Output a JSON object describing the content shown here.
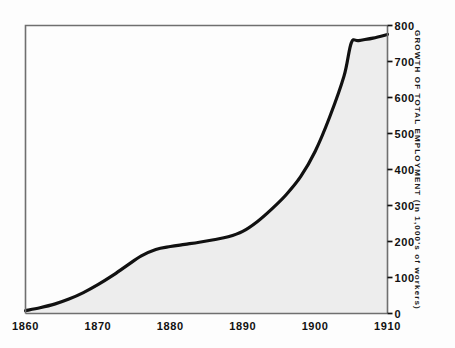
{
  "chart_data": {
    "type": "area",
    "title": "",
    "subtitle": "",
    "xlabel": "",
    "ylabel": "GROWTH OF TOTAL EMPLOYMENT (in 1,000's of workers)",
    "xlim": [
      1860,
      1910
    ],
    "ylim": [
      0,
      800
    ],
    "xticks": [
      1860,
      1870,
      1880,
      1890,
      1900,
      1910
    ],
    "xtick_labels": [
      "1860",
      "1870",
      "1880",
      "1890",
      "1900",
      "1910"
    ],
    "yticks": [
      0,
      100,
      200,
      300,
      400,
      500,
      600,
      700,
      800
    ],
    "ytick_labels": [
      "0",
      "100",
      "200",
      "300",
      "400",
      "500",
      "600",
      "700",
      "800"
    ],
    "grid": false,
    "legend": null,
    "y_axis_position": "right",
    "series": [
      {
        "name": "Total employment",
        "x": [
          1860,
          1862,
          1864,
          1866,
          1868,
          1870,
          1872,
          1874,
          1876,
          1878,
          1880,
          1882,
          1884,
          1886,
          1888,
          1890,
          1892,
          1894,
          1896,
          1898,
          1900,
          1902,
          1904,
          1905,
          1906,
          1908,
          1910
        ],
        "values": [
          8,
          16,
          26,
          40,
          58,
          80,
          105,
          133,
          160,
          178,
          186,
          192,
          198,
          205,
          213,
          228,
          255,
          290,
          330,
          380,
          450,
          545,
          660,
          752,
          758,
          765,
          775
        ]
      }
    ],
    "colors": {
      "line": "#111111",
      "fill": "#ededed",
      "axis": "#6f6f6f",
      "text": "#111111",
      "background": "#fdfdfd"
    },
    "annotations": []
  },
  "axes": {
    "tick_mark_name": "y-axis-tick-mark",
    "frame_name": "plot-frame"
  }
}
